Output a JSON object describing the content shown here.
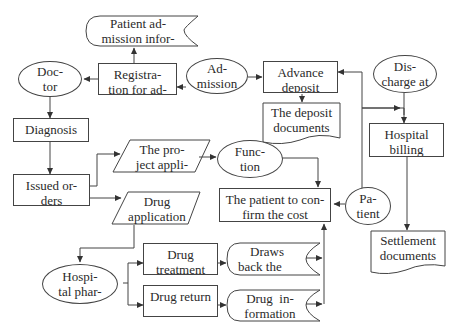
{
  "diagram": {
    "type": "flowchart",
    "title": "",
    "line_color": "#444444",
    "nodes": {
      "patient_admission_info": {
        "shape": "stored-data",
        "line1": "Patient ad-",
        "line2": "mission infor-"
      },
      "doctor": {
        "shape": "ellipse",
        "line1": "Doc-",
        "line2": "tor"
      },
      "registration": {
        "shape": "rect",
        "line1": "Registra-",
        "line2": "tion for ad-"
      },
      "admission": {
        "shape": "ellipse",
        "line1": "Ad-",
        "line2": "mission"
      },
      "advance_deposit": {
        "shape": "rect",
        "line1": "Advance",
        "line2": "deposit"
      },
      "discharge": {
        "shape": "ellipse",
        "line1": "Dis-",
        "line2": "charge at"
      },
      "deposit_documents": {
        "shape": "document",
        "line1": "The deposit",
        "line2": "documents"
      },
      "diagnosis": {
        "shape": "rect",
        "line1": "Diagnosis",
        "line2": ""
      },
      "hospital_billing": {
        "shape": "rect",
        "line1": "Hospital",
        "line2": "billing"
      },
      "project_application": {
        "shape": "parallelogram",
        "line1": "The pro-",
        "line2": "ject appli-"
      },
      "function": {
        "shape": "ellipse",
        "line1": "Func-",
        "line2": "tion"
      },
      "issued_orders": {
        "shape": "rect",
        "line1": "Issued or-",
        "line2": "ders"
      },
      "drug_application": {
        "shape": "parallelogram",
        "line1": "Drug",
        "line2": "application"
      },
      "confirm_cost": {
        "shape": "rect",
        "line1": "The patient to con-",
        "line2": "firm the cost"
      },
      "patient": {
        "shape": "ellipse",
        "line1": "Pa-",
        "line2": "tient"
      },
      "settlement_documents": {
        "shape": "document",
        "line1": "Settlement",
        "line2": "documents"
      },
      "hospital_pharmacy": {
        "shape": "ellipse",
        "line1": "Hospi-",
        "line2": "tal phar-"
      },
      "drug_treatment": {
        "shape": "rect",
        "line1": "Drug",
        "line2": "treatment"
      },
      "draws_back": {
        "shape": "stored-data",
        "line1": "Draws",
        "line2": "back the"
      },
      "drug_return": {
        "shape": "rect",
        "line1": "Drug return",
        "line2": ""
      },
      "drug_information": {
        "shape": "stored-data",
        "line1": "Drug  in-",
        "line2": "formation"
      }
    },
    "edges": [
      [
        "admission",
        "registration"
      ],
      [
        "registration",
        "patient_admission_info"
      ],
      [
        "registration",
        "doctor"
      ],
      [
        "admission",
        "advance_deposit"
      ],
      [
        "advance_deposit",
        "deposit_documents"
      ],
      [
        "doctor",
        "diagnosis"
      ],
      [
        "diagnosis",
        "issued_orders"
      ],
      [
        "issued_orders",
        "project_application"
      ],
      [
        "issued_orders",
        "drug_application"
      ],
      [
        "project_application",
        "function"
      ],
      [
        "function",
        "confirm_cost"
      ],
      [
        "patient",
        "confirm_cost"
      ],
      [
        "patient",
        "advance_deposit"
      ],
      [
        "advance_deposit",
        "hospital_billing"
      ],
      [
        "discharge",
        "hospital_billing"
      ],
      [
        "hospital_billing",
        "settlement_documents"
      ],
      [
        "drug_application",
        "hospital_pharmacy"
      ],
      [
        "hospital_pharmacy",
        "drug_treatment"
      ],
      [
        "hospital_pharmacy",
        "drug_return"
      ],
      [
        "drug_treatment",
        "draws_back"
      ],
      [
        "drug_return",
        "drug_information"
      ],
      [
        "draws_back",
        "confirm_cost"
      ],
      [
        "drug_information",
        "confirm_cost"
      ]
    ]
  }
}
